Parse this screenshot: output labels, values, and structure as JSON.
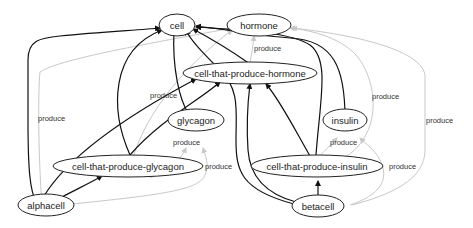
{
  "diagram": {
    "type": "directed-graph",
    "nodes": {
      "cell": "cell",
      "hormone": "hormone",
      "cell_that_produce_hormone": "cell-that-produce-hormone",
      "glycagon": "glycagon",
      "insulin": "insulin",
      "cell_that_produce_glycagon": "cell-that-produce-glycagon",
      "cell_that_produce_insulin": "cell-that-produce-insulin",
      "alphacell": "alphacell",
      "betacell": "betacell"
    },
    "edge_labels": {
      "hormone_produce": "produce",
      "alphacell_produce_left": "produce",
      "glycagon_produce_top": "produce",
      "glycagon_produce_mid": "produce",
      "glycagon_produce_right": "produce",
      "insulin_produce_top": "produce",
      "insulin_produce_mid": "produce",
      "insulin_produce_right": "produce",
      "far_right_produce": "produce"
    },
    "edges": [
      {
        "from": "alphacell",
        "to": "cell",
        "style": "dark"
      },
      {
        "from": "alphacell",
        "to": "cell-that-produce-glycagon",
        "style": "dark"
      },
      {
        "from": "alphacell",
        "to": "cell-that-produce-hormone",
        "style": "dark"
      },
      {
        "from": "alphacell",
        "to": "glycagon",
        "style": "light",
        "label": "produce"
      },
      {
        "from": "alphacell",
        "to": "hormone",
        "style": "light",
        "label": "produce"
      },
      {
        "from": "cell-that-produce-glycagon",
        "to": "cell",
        "style": "dark"
      },
      {
        "from": "cell-that-produce-glycagon",
        "to": "cell-that-produce-hormone",
        "style": "dark"
      },
      {
        "from": "cell-that-produce-glycagon",
        "to": "glycagon",
        "style": "light",
        "label": "produce"
      },
      {
        "from": "cell-that-produce-glycagon",
        "to": "hormone",
        "style": "light",
        "label": "produce"
      },
      {
        "from": "glycagon",
        "to": "cell",
        "style": "dark"
      },
      {
        "from": "cell-that-produce-hormone",
        "to": "cell",
        "style": "dark"
      },
      {
        "from": "cell-that-produce-hormone",
        "to": "hormone",
        "style": "light",
        "label": "produce"
      },
      {
        "from": "insulin",
        "to": "cell",
        "style": "dark"
      },
      {
        "from": "cell-that-produce-insulin",
        "to": "cell",
        "style": "dark"
      },
      {
        "from": "cell-that-produce-insulin",
        "to": "cell-that-produce-hormone",
        "style": "dark"
      },
      {
        "from": "cell-that-produce-insulin",
        "to": "insulin",
        "style": "light",
        "label": "produce"
      },
      {
        "from": "cell-that-produce-insulin",
        "to": "hormone",
        "style": "light",
        "label": "produce"
      },
      {
        "from": "betacell",
        "to": "cell-that-produce-insulin",
        "style": "dark"
      },
      {
        "from": "betacell",
        "to": "cell-that-produce-hormone",
        "style": "dark"
      },
      {
        "from": "betacell",
        "to": "cell",
        "style": "dark"
      },
      {
        "from": "betacell",
        "to": "insulin",
        "style": "light",
        "label": "produce"
      },
      {
        "from": "betacell",
        "to": "hormone",
        "style": "light",
        "label": "produce"
      }
    ]
  }
}
